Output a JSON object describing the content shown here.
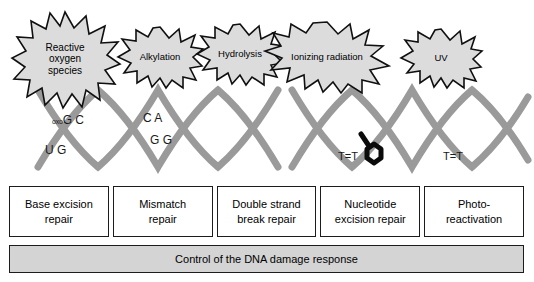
{
  "figure": {
    "helix_color": "#9a9a9a",
    "burst_fill": "#dcdcdc",
    "burst_stroke": "#101010",
    "control_bar_fill": "#d4d4d4"
  },
  "damage_sources": [
    {
      "id": "reactive-oxygen-species",
      "label": "Reactive\noxygen\nspecies",
      "font_size": 10
    },
    {
      "id": "alkylation",
      "label": "Alkylation",
      "font_size": 9.5
    },
    {
      "id": "hydrolysis",
      "label": "Hydrolysis",
      "font_size": 9.5
    },
    {
      "id": "ionizing-radiation",
      "label": "Ionizing radiation",
      "font_size": 9.5
    },
    {
      "id": "uv",
      "label": "UV",
      "font_size": 9.5
    }
  ],
  "lesions": [
    {
      "id": "oxog-c",
      "prefix": "oxo",
      "text": "G C"
    },
    {
      "id": "u-g",
      "prefix": "",
      "text": "U G"
    },
    {
      "id": "c-a",
      "prefix": "",
      "text": "C A"
    },
    {
      "id": "g-g",
      "prefix": "",
      "text": "G G"
    },
    {
      "id": "thymine-dimer-1",
      "prefix": "",
      "text": "T=T"
    },
    {
      "id": "thymine-dimer-2",
      "prefix": "",
      "text": "T=T"
    }
  ],
  "repair_pathways": [
    {
      "id": "base-excision-repair",
      "label": "Base excision\nrepair"
    },
    {
      "id": "mismatch-repair",
      "label": "Mismatch\nrepair"
    },
    {
      "id": "double-strand-break-repair",
      "label": "Double strand\nbreak repair"
    },
    {
      "id": "nucleotide-excision-repair",
      "label": "Nucleotide\nexcision repair"
    },
    {
      "id": "photo-reactivation",
      "label": "Photo-\nreactivation"
    }
  ],
  "control": {
    "label": "Control of the DNA damage response"
  }
}
